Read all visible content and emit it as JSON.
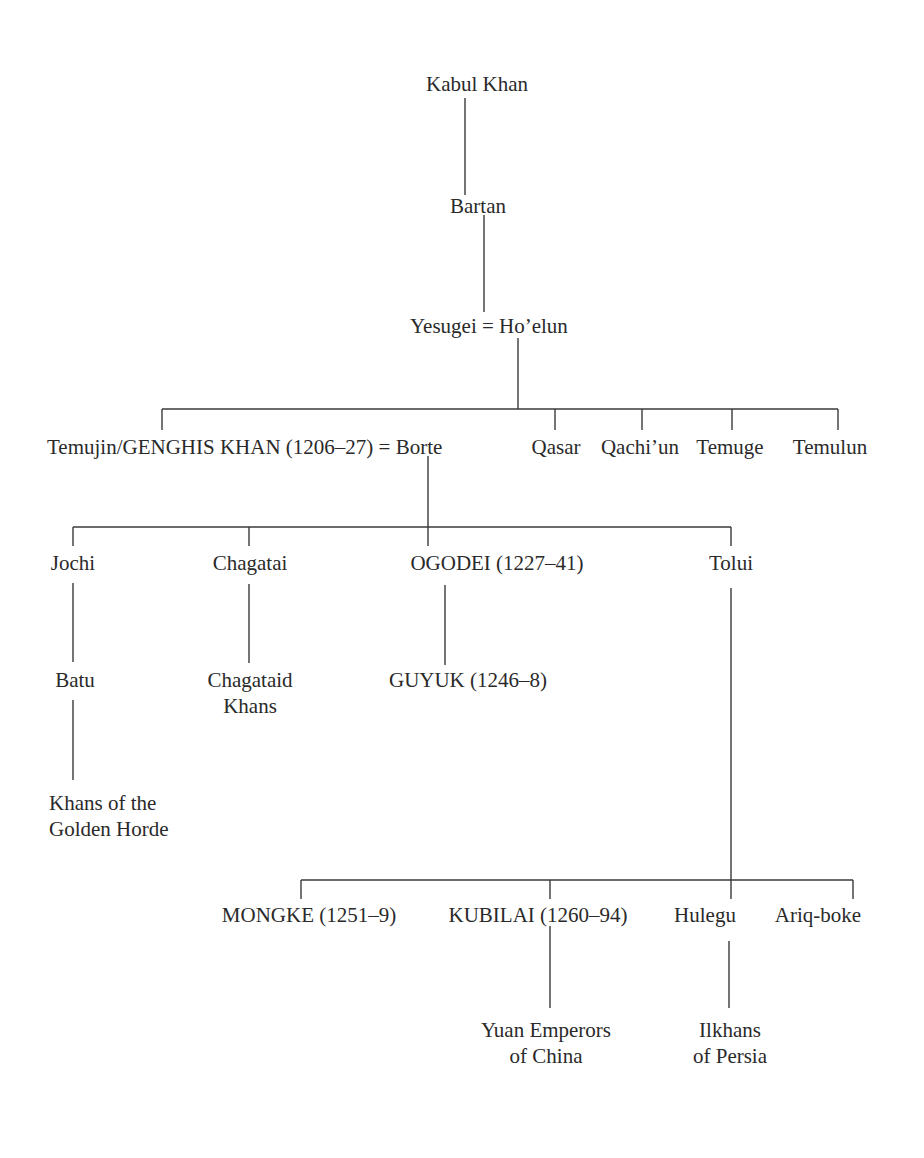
{
  "diagram": {
    "type": "genealogy-tree",
    "generation0": {
      "kabul_khan": "Kabul Khan",
      "bartan": "Bartan",
      "yesugei_hoelun": "Yesugei = Ho’elun"
    },
    "generation1": {
      "genghis_borte": "Temujin/GENGHIS KHAN (1206–27) = Borte",
      "siblings": [
        "Qasar",
        "Qachi’un",
        "Temuge",
        "Temulun"
      ]
    },
    "generation2": {
      "sons": [
        "Jochi",
        "Chagatai",
        "OGODEI (1227–41)",
        "Tolui"
      ]
    },
    "generation3": {
      "batu": "Batu",
      "chagataid_line1": "Chagataid",
      "chagataid_line2": "Khans",
      "guyuk": "GUYUK (1246–8)",
      "golden_horde_line1": "Khans of the",
      "golden_horde_line2": "Golden Horde"
    },
    "tolui_sons": [
      "MONGKE (1251–9)",
      "KUBILAI (1260–94)",
      "Hulegu",
      "Ariq-boke"
    ],
    "descendants": {
      "yuan_line1": "Yuan Emperors",
      "yuan_line2": "of China",
      "ilkhans_line1": "Ilkhans",
      "ilkhans_line2": "of Persia"
    },
    "line_color": "#3a3a3a",
    "text_color": "#2a2a2a"
  }
}
